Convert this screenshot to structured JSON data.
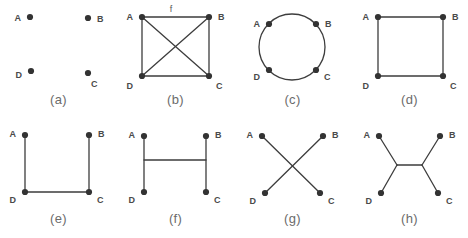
{
  "figure": {
    "title": "",
    "node_labels": [
      "A",
      "B",
      "C",
      "D"
    ],
    "edge_label": "f",
    "colors": {
      "edge": "#3d3d3d",
      "node": "#333333",
      "label": "#4a4a4a",
      "caption": "#6b6b6b",
      "background": "#ffffff"
    },
    "panels": [
      {
        "caption": "(a)",
        "description": "four isolated vertices, no edges",
        "nodes": [
          {
            "id": "A",
            "x": 30,
            "y": 17,
            "label_dx": -9,
            "label_dy": 1
          },
          {
            "id": "B",
            "x": 88,
            "y": 18,
            "label_dx": 9,
            "label_dy": 1
          },
          {
            "id": "C",
            "x": 88,
            "y": 73,
            "label_dx": 3,
            "label_dy": 11
          },
          {
            "id": "D",
            "x": 31,
            "y": 71,
            "label_dx": -9,
            "label_dy": 4
          }
        ],
        "edges": []
      },
      {
        "caption": "(b)",
        "description": "complete graph on four vertices with labeled top edge f",
        "nodes": [
          {
            "id": "A",
            "x": 25,
            "y": 17,
            "label_dx": -9,
            "label_dy": 0
          },
          {
            "id": "B",
            "x": 92,
            "y": 17,
            "label_dx": 9,
            "label_dy": 0
          },
          {
            "id": "C",
            "x": 92,
            "y": 76,
            "label_dx": 7,
            "label_dy": 10
          },
          {
            "id": "D",
            "x": 25,
            "y": 76,
            "label_dx": -9,
            "label_dy": 10
          }
        ],
        "edges": [
          {
            "from": "A",
            "to": "B",
            "label": "f"
          },
          {
            "from": "B",
            "to": "C",
            "label": ""
          },
          {
            "from": "C",
            "to": "D",
            "label": ""
          },
          {
            "from": "D",
            "to": "A",
            "label": ""
          },
          {
            "from": "A",
            "to": "C",
            "label": ""
          },
          {
            "from": "B",
            "to": "D",
            "label": ""
          }
        ],
        "edge_label_pos": {
          "x": 54,
          "y": 12
        }
      },
      {
        "caption": "(c)",
        "description": "four vertices placed on a circle",
        "circle": {
          "cx": 58,
          "cy": 47,
          "r": 33
        },
        "nodes": [
          {
            "id": "A",
            "x": 35,
            "y": 24,
            "label_dx": -9,
            "label_dy": 0
          },
          {
            "id": "B",
            "x": 82,
            "y": 24,
            "label_dx": 9,
            "label_dy": 0
          },
          {
            "id": "C",
            "x": 82,
            "y": 70,
            "label_dx": 8,
            "label_dy": 7
          },
          {
            "id": "D",
            "x": 35,
            "y": 70,
            "label_dx": -9,
            "label_dy": 7
          }
        ],
        "edges": []
      },
      {
        "caption": "(d)",
        "description": "four-cycle square A-B-C-D-A",
        "nodes": [
          {
            "id": "A",
            "x": 27,
            "y": 17,
            "label_dx": -9,
            "label_dy": 0
          },
          {
            "id": "B",
            "x": 92,
            "y": 17,
            "label_dx": 9,
            "label_dy": 0
          },
          {
            "id": "C",
            "x": 92,
            "y": 76,
            "label_dx": 7,
            "label_dy": 10
          },
          {
            "id": "D",
            "x": 27,
            "y": 76,
            "label_dx": -9,
            "label_dy": 10
          }
        ],
        "edges": [
          {
            "from": "A",
            "to": "B",
            "label": ""
          },
          {
            "from": "B",
            "to": "C",
            "label": ""
          },
          {
            "from": "C",
            "to": "D",
            "label": ""
          },
          {
            "from": "D",
            "to": "A",
            "label": ""
          }
        ]
      },
      {
        "caption": "(e)",
        "description": "open U-shaped path A-D-C-B",
        "nodes": [
          {
            "id": "A",
            "x": 25,
            "y": 16,
            "label_dx": -9,
            "label_dy": -1
          },
          {
            "id": "B",
            "x": 89,
            "y": 16,
            "label_dx": 9,
            "label_dy": -1
          },
          {
            "id": "C",
            "x": 89,
            "y": 73,
            "label_dx": 8,
            "label_dy": 8
          },
          {
            "id": "D",
            "x": 25,
            "y": 73,
            "label_dx": -9,
            "label_dy": 8
          }
        ],
        "edges": [
          {
            "from": "A",
            "to": "D",
            "label": ""
          },
          {
            "from": "D",
            "to": "C",
            "label": ""
          },
          {
            "from": "C",
            "to": "B",
            "label": ""
          }
        ]
      },
      {
        "caption": "(f)",
        "description": "H-shaped graph, vertical A-D and B-C joined by a crossbar",
        "nodes": [
          {
            "id": "A",
            "x": 27,
            "y": 17,
            "label_dx": -9,
            "label_dy": -1
          },
          {
            "id": "B",
            "x": 89,
            "y": 17,
            "label_dx": 9,
            "label_dy": -1
          },
          {
            "id": "C",
            "x": 89,
            "y": 73,
            "label_dx": 8,
            "label_dy": 8
          },
          {
            "id": "D",
            "x": 27,
            "y": 73,
            "label_dx": -9,
            "label_dy": 8
          }
        ],
        "edges": [
          {
            "from": "A",
            "to": "D",
            "label": ""
          },
          {
            "from": "B",
            "to": "C",
            "label": ""
          }
        ],
        "crossbar": {
          "x1": 27,
          "y1": 41,
          "x2": 89,
          "y2": 41
        }
      },
      {
        "caption": "(g)",
        "description": "crossing diagonals A-C and B-D",
        "nodes": [
          {
            "id": "A",
            "x": 28,
            "y": 17,
            "label_dx": -9,
            "label_dy": -1
          },
          {
            "id": "B",
            "x": 89,
            "y": 17,
            "label_dx": 9,
            "label_dy": -1
          },
          {
            "id": "C",
            "x": 86,
            "y": 74,
            "label_dx": 8,
            "label_dy": 8
          },
          {
            "id": "D",
            "x": 31,
            "y": 74,
            "label_dx": -9,
            "label_dy": 8
          }
        ],
        "edges": [
          {
            "from": "A",
            "to": "C",
            "label": ""
          },
          {
            "from": "B",
            "to": "D",
            "label": ""
          }
        ]
      },
      {
        "caption": "(h)",
        "description": "unrooted tree with two internal branch points joining A,D and B,C",
        "nodes": [
          {
            "id": "A",
            "x": 28,
            "y": 17,
            "label_dx": -9,
            "label_dy": -1
          },
          {
            "id": "B",
            "x": 89,
            "y": 17,
            "label_dx": 9,
            "label_dy": -1
          },
          {
            "id": "C",
            "x": 87,
            "y": 74,
            "label_dx": 8,
            "label_dy": 8
          },
          {
            "id": "D",
            "x": 30,
            "y": 74,
            "label_dx": -9,
            "label_dy": 8
          }
        ],
        "internal_nodes": [
          {
            "id": "i1",
            "x": 46,
            "y": 46
          },
          {
            "id": "i2",
            "x": 71,
            "y": 46
          }
        ],
        "edges": [
          {
            "from": "A",
            "to": "i1",
            "label": ""
          },
          {
            "from": "D",
            "to": "i1",
            "label": ""
          },
          {
            "from": "i1",
            "to": "i2",
            "label": ""
          },
          {
            "from": "B",
            "to": "i2",
            "label": ""
          },
          {
            "from": "C",
            "to": "i2",
            "label": ""
          }
        ]
      }
    ]
  }
}
